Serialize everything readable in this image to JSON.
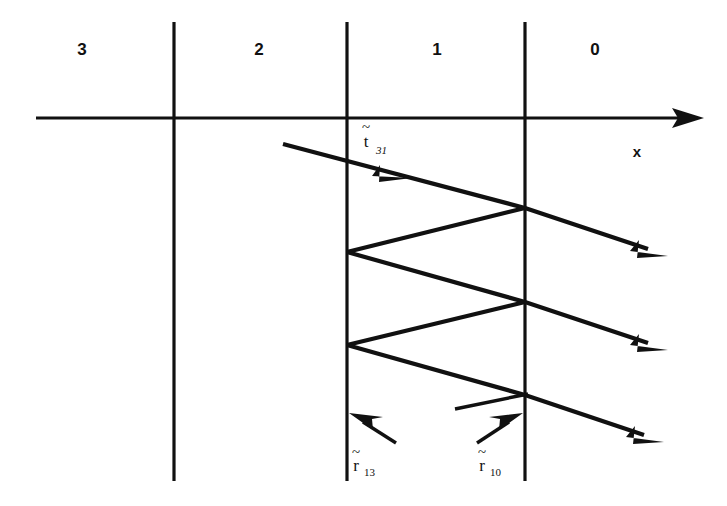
{
  "figure": {
    "background_color": "#ffffff",
    "ink_color": "#111111",
    "width": 727,
    "height": 506
  },
  "axis": {
    "name": "x-axis",
    "label": "x",
    "label_x": 637,
    "label_y": 157,
    "y": 118,
    "x_start": 36,
    "x_end": 704,
    "arrow_direction": "right"
  },
  "regions": [
    {
      "label": "3",
      "x": 82,
      "y": 48
    },
    {
      "label": "2",
      "x": 259,
      "y": 48
    },
    {
      "label": "1",
      "x": 437,
      "y": 48
    },
    {
      "label": "0",
      "x": 595,
      "y": 48
    }
  ],
  "boundaries": [
    {
      "name": "boundary-3-2",
      "x": 174,
      "y_top": 22,
      "y_bottom": 481
    },
    {
      "name": "boundary-2-1",
      "x": 347,
      "y_top": 22,
      "y_bottom": 481
    },
    {
      "name": "boundary-1-0",
      "x": 525,
      "y_top": 22,
      "y_bottom": 481
    }
  ],
  "coefficients": {
    "transmission": {
      "name": "t-tilde-31",
      "base": "t",
      "subscript": "31",
      "tilde": "~",
      "x": 366,
      "y": 143,
      "description": "transmission amplitude coefficient from medium 3 into medium 1"
    },
    "reflection_13": {
      "name": "r-tilde-13",
      "base": "r",
      "subscript": "13",
      "tilde": "~",
      "x": 358,
      "y": 468,
      "description": "reflection amplitude coefficient at the 1-3 boundary"
    },
    "reflection_10": {
      "name": "r-tilde-10",
      "base": "r",
      "subscript": "10",
      "tilde": "~",
      "x": 484,
      "y": 468,
      "description": "reflection amplitude coefficient at the 1-0 boundary"
    }
  },
  "rays": {
    "incident": {
      "name": "incident-ray",
      "points": "283,144 525,208",
      "mid_arrow_at": "404,176"
    },
    "internal_bounces": [
      {
        "name": "bounce-1",
        "points": "525,208 347,252"
      },
      {
        "name": "bounce-2",
        "points": "347,252 525,302"
      },
      {
        "name": "bounce-3",
        "points": "525,302 347,345"
      },
      {
        "name": "bounce-4",
        "points": "347,345 525,395"
      }
    ],
    "exits": [
      {
        "name": "exit-ray-1",
        "from": "525,208",
        "to": "664,254"
      },
      {
        "name": "exit-ray-2",
        "from": "525,302",
        "to": "664,348"
      },
      {
        "name": "exit-ray-3",
        "from": "525,395",
        "to": "660,440"
      }
    ],
    "reflection_arrows": [
      {
        "name": "reflection-arrow-13",
        "from": "394,441",
        "to": "351,414"
      },
      {
        "name": "reflection-arrow-10",
        "from": "477,441",
        "to": "521,414"
      }
    ],
    "stub_segment": {
      "name": "partial-reflection-stub",
      "from": "455,408",
      "to": "525,395"
    }
  }
}
